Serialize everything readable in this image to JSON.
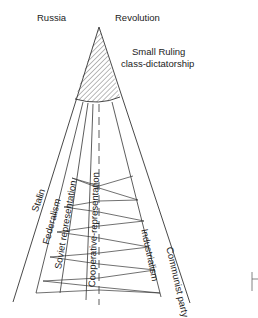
{
  "diagram": {
    "top_labels": {
      "left": "Russia",
      "right": "Revolution"
    },
    "apex_label": {
      "line1": "Small Ruling",
      "line2": "class-dictatorship"
    },
    "band_labels": [
      {
        "id": "stalin",
        "text": "Stalin"
      },
      {
        "id": "federalism",
        "text": "Federalism"
      },
      {
        "id": "soviet",
        "text": "Soviet representation"
      },
      {
        "id": "cooperative",
        "text": "Cooperative-representation"
      },
      {
        "id": "industrialism",
        "text": "Industrialism"
      },
      {
        "id": "communist",
        "text": "Communist party"
      }
    ],
    "colors": {
      "line": "#333333",
      "hatch": "#555555",
      "background": "#ffffff"
    }
  }
}
